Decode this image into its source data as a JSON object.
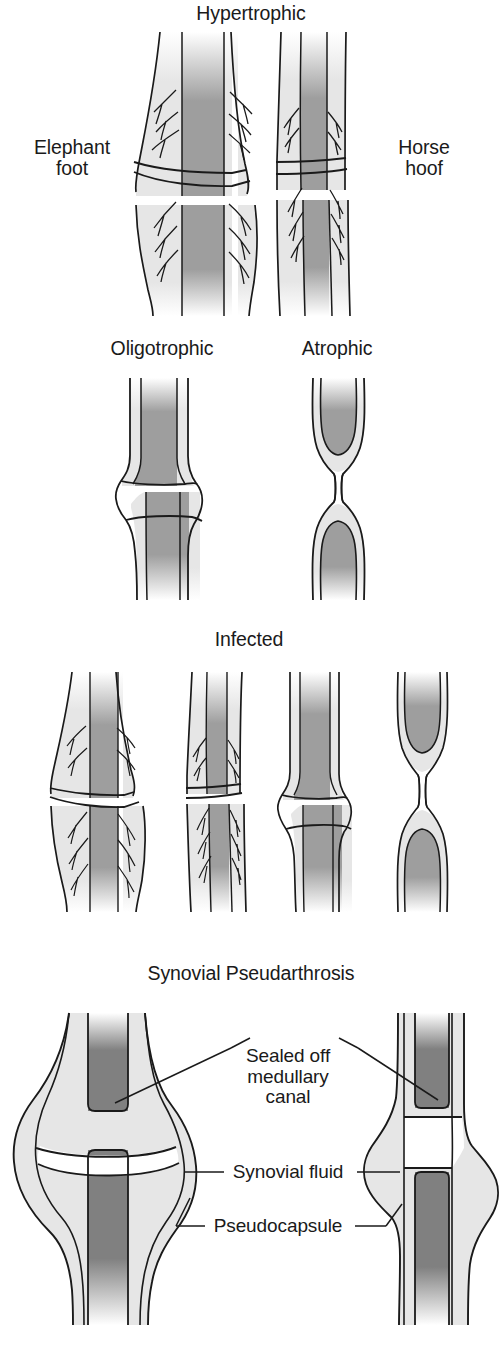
{
  "figure": {
    "type": "medical-illustration",
    "background_color": "#ffffff",
    "colors": {
      "outline": "#1a1a1a",
      "cortex_light_gray": "#e6e6e6",
      "medullary_mid_gray": "#9e9e9e",
      "medullary_dark_gray": "#808080",
      "fluid_white": "#ffffff",
      "text": "#1a1a1a"
    }
  },
  "sections": [
    {
      "id": "hypertrophic",
      "title": "Hypertrophic",
      "title_x": 263,
      "title_y": 3,
      "labels": [
        {
          "id": "elephant-foot",
          "text": "Elephant\nfoot",
          "x": 72,
          "y": 137
        },
        {
          "id": "horse-hoof",
          "text": "Horse\nhoof",
          "x": 424,
          "y": 137
        }
      ],
      "figures": [
        "elephant-foot-bone",
        "horse-hoof-bone"
      ]
    },
    {
      "id": "oligotrophic-atrophic",
      "titles": [
        {
          "id": "oligotrophic",
          "text": "Oligotrophic",
          "x": 162,
          "y": 338
        },
        {
          "id": "atrophic",
          "text": "Atrophic",
          "x": 337,
          "y": 338
        }
      ],
      "figures": [
        "oligotrophic-bone",
        "atrophic-bone"
      ]
    },
    {
      "id": "infected",
      "title": "Infected",
      "title_x": 249,
      "title_y": 629,
      "figures": [
        "infected-elephant-foot",
        "infected-horse-hoof",
        "infected-oligotrophic",
        "infected-atrophic"
      ]
    },
    {
      "id": "synovial-pseudarthrosis",
      "title": "Synovial Pseudarthrosis",
      "title_x": 251,
      "title_y": 963,
      "figures": [
        "synovial-ap-view",
        "synovial-lateral-view"
      ],
      "callouts": [
        {
          "id": "sealed-off-medullary-canal",
          "text": "Sealed off\nmedullary\ncanal",
          "x": 288,
          "y": 1046
        },
        {
          "id": "synovial-fluid",
          "text": "Synovial fluid",
          "x": 288,
          "y": 1163
        },
        {
          "id": "pseudocapsule",
          "text": "Pseudocapsule",
          "x": 288,
          "y": 1217
        }
      ]
    }
  ]
}
